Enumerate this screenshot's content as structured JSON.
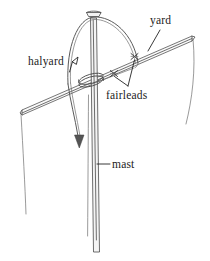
{
  "figure": {
    "background_color": "#ffffff",
    "ink_color": "#4a4a4a",
    "label_color": "#1b1b1b"
  },
  "labels": {
    "halyard": "halyard",
    "yard": "yard",
    "fairleads": "fairleads",
    "mast": "mast"
  },
  "parts": [
    {
      "id": "mast",
      "name": "mast",
      "description": "vertical spar running from truck at top to bottom of frame"
    },
    {
      "id": "yard",
      "name": "yard",
      "description": "diagonal spar crossing the mast, rising left to right"
    },
    {
      "id": "halyard",
      "name": "halyard",
      "description": "rope arching over the masthead and descending with a downward arrow"
    },
    {
      "id": "fairleads",
      "name": "fairleads",
      "description": "two cross-marked lashing points on the yard"
    }
  ],
  "annotations": {
    "halyard_leader": "leader line from halyard label to the rope on the left",
    "yard_leader": "leader line from yard label down-left to the yard spar",
    "fairleads_leaders": "two leader lines from the fairleads label up to each cross mark",
    "mast_leader": "short horizontal leader line from the mast label to the mast",
    "halyard_arrow": "downward arrowhead at the hauling end of the halyard"
  }
}
